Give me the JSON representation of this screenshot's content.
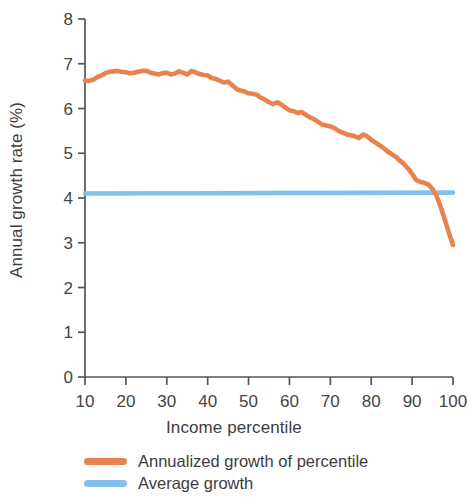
{
  "chart_data": {
    "type": "line",
    "title": "",
    "xlabel": "Income percentile",
    "ylabel": "Annual growth rate (%)",
    "xlim": [
      10,
      100
    ],
    "ylim": [
      0,
      8
    ],
    "xticks": [
      10,
      20,
      30,
      40,
      50,
      60,
      70,
      80,
      90,
      100
    ],
    "yticks": [
      0,
      1,
      2,
      3,
      4,
      5,
      6,
      7,
      8
    ],
    "grid": false,
    "legend_position": "bottom-center",
    "colors": {
      "annualized_growth": "#E8834E",
      "average_growth": "#85C0EA",
      "axis": "#555555",
      "text": "#3d3d3d"
    },
    "series": [
      {
        "name": "Annualized growth of percentile",
        "color": "#E8834E",
        "x": [
          10,
          11,
          12,
          13,
          14,
          15,
          16,
          17,
          18,
          19,
          20,
          21,
          22,
          23,
          24,
          25,
          26,
          27,
          28,
          29,
          30,
          31,
          32,
          33,
          34,
          35,
          36,
          37,
          38,
          39,
          40,
          41,
          42,
          43,
          44,
          45,
          46,
          47,
          48,
          49,
          50,
          51,
          52,
          53,
          54,
          55,
          56,
          57,
          58,
          59,
          60,
          61,
          62,
          63,
          64,
          65,
          66,
          67,
          68,
          69,
          70,
          71,
          72,
          73,
          74,
          75,
          76,
          77,
          78,
          79,
          80,
          81,
          82,
          83,
          84,
          85,
          86,
          87,
          88,
          89,
          90,
          91,
          92,
          93,
          94,
          95,
          96,
          97,
          98,
          99,
          100
        ],
        "values": [
          6.62,
          6.62,
          6.64,
          6.7,
          6.74,
          6.79,
          6.82,
          6.83,
          6.84,
          6.82,
          6.81,
          6.79,
          6.8,
          6.82,
          6.84,
          6.84,
          6.8,
          6.78,
          6.76,
          6.79,
          6.8,
          6.76,
          6.78,
          6.83,
          6.8,
          6.76,
          6.84,
          6.81,
          6.77,
          6.75,
          6.74,
          6.68,
          6.66,
          6.62,
          6.58,
          6.6,
          6.52,
          6.44,
          6.4,
          6.38,
          6.34,
          6.33,
          6.31,
          6.24,
          6.2,
          6.14,
          6.1,
          6.14,
          6.09,
          6.02,
          5.96,
          5.94,
          5.9,
          5.92,
          5.86,
          5.8,
          5.76,
          5.7,
          5.64,
          5.62,
          5.6,
          5.56,
          5.5,
          5.46,
          5.42,
          5.4,
          5.38,
          5.34,
          5.42,
          5.38,
          5.3,
          5.24,
          5.18,
          5.12,
          5.04,
          4.98,
          4.92,
          4.84,
          4.76,
          4.66,
          4.54,
          4.4,
          4.36,
          4.34,
          4.3,
          4.2,
          4.04,
          3.8,
          3.52,
          3.22,
          2.95
        ]
      },
      {
        "name": "Average growth",
        "color": "#85C0EA",
        "x": [
          10,
          100
        ],
        "values": [
          4.1,
          4.12
        ]
      }
    ]
  },
  "legend": {
    "items": [
      {
        "label": "Annualized growth of percentile",
        "color": "#E8834E"
      },
      {
        "label": "Average growth",
        "color": "#85C0EA"
      }
    ]
  },
  "axes": {
    "x_title": "Income percentile",
    "y_title": "Annual growth rate (%)"
  }
}
